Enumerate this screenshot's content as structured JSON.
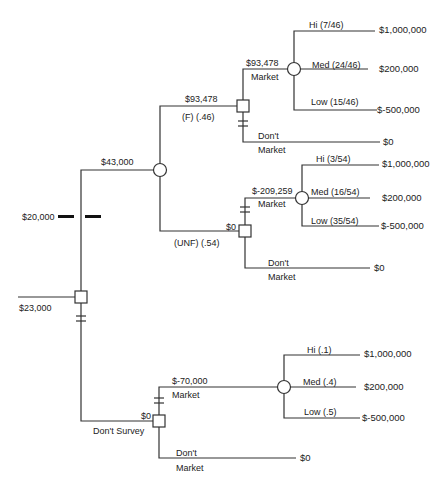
{
  "diagram": {
    "type": "decision-tree",
    "root": {
      "value": "$23,000",
      "survey_cost": "$20,000"
    },
    "survey_branch": {
      "value": "$43,000",
      "favorable": {
        "label": "(F)  (.46)",
        "value": "$93,478",
        "market": {
          "label": "Market",
          "value": "$93,478",
          "outcomes": [
            {
              "label": "Hi   (7/46)",
              "payoff": "$1,000,000"
            },
            {
              "label": "Med (24/46)",
              "payoff": "$200,000"
            },
            {
              "label": "Low (15/46)",
              "payoff": "$-500,000"
            }
          ]
        },
        "dont_market": {
          "label_line1": "Don't",
          "label_line2": "Market",
          "payoff": "$0"
        }
      },
      "unfavorable": {
        "label": "(UNF) (.54)",
        "value": "$0",
        "market": {
          "label": "Market",
          "value": "$-209,259",
          "outcomes": [
            {
              "label": "Hi (3/54)",
              "payoff": "$1,000,000"
            },
            {
              "label": "Med (16/54)",
              "payoff": "$200,000"
            },
            {
              "label": "Low (35/54)",
              "payoff": "$-500,000"
            }
          ]
        },
        "dont_market": {
          "label_line1": "Don't",
          "label_line2": "Market",
          "payoff": "$0"
        }
      }
    },
    "no_survey_branch": {
      "label": "Don't Survey",
      "value": "$0",
      "market": {
        "label": "Market",
        "value": "$-70,000",
        "outcomes": [
          {
            "label": "Hi  (.1)",
            "payoff": "$1,000,000"
          },
          {
            "label": "Med (.4)",
            "payoff": "$200,000"
          },
          {
            "label": "Low (.5)",
            "payoff": "$-500,000"
          }
        ]
      },
      "dont_market": {
        "label_line1": "Don't",
        "label_line2": "Market",
        "payoff": "$0"
      }
    }
  }
}
